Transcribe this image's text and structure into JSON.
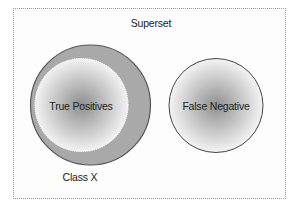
{
  "diagram": {
    "type": "venn-set-diagram",
    "superset": {
      "label": "Superset",
      "border_style": "dotted",
      "border_color": "#9a9a9a"
    },
    "sets": [
      {
        "id": "class-x",
        "label": "Class X",
        "fill": "#a9a9a9",
        "stroke": "#555555",
        "contains": [
          "true-positives"
        ]
      },
      {
        "id": "true-positives",
        "label": "True Positives",
        "fill_gradient": [
          "#8e8e8e",
          "#f2f2f2"
        ],
        "stroke": "#ffffff",
        "stroke_style": "dotted"
      },
      {
        "id": "false-negative",
        "label": "False Negative",
        "fill_gradient": [
          "#909090",
          "#f4f4f4"
        ],
        "stroke": "#444444"
      }
    ]
  }
}
